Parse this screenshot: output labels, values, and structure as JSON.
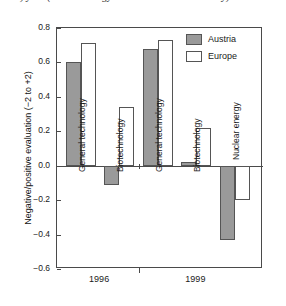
{
  "caption": "2.5.5) year (nuclear energy data collected in 1999 only)",
  "legend": {
    "position": "top-right",
    "entries": [
      {
        "label": "Austria",
        "swatch": "austria",
        "color": "#9a9a9a"
      },
      {
        "label": "Europe",
        "swatch": "europe",
        "color": "#ffffff"
      }
    ]
  },
  "axes": {
    "ylabel": "Negative/positive evaluation (−2 to +2)",
    "yticks": [
      0.8,
      0.6,
      0.4,
      0.2,
      0.0,
      -0.2,
      -0.4,
      -0.6
    ],
    "ytick_labels": [
      "0.8",
      "0.6",
      "0.4",
      "0.2",
      "0.0",
      "−0.2",
      "−0.4",
      "−0.6"
    ],
    "ylim": [
      -0.6,
      0.8
    ],
    "xlabel": ""
  },
  "groups": [
    {
      "label": "1996"
    },
    {
      "label": "1999"
    }
  ],
  "bar_labels": [
    "General technology",
    "Biotechnology",
    "General technology",
    "Biotechnology",
    "Nuclear energy"
  ],
  "chart_data": {
    "type": "bar",
    "title": "",
    "subtitle": "",
    "xlabel": "",
    "ylabel": "Negative/positive evaluation (−2 to +2)",
    "ylim": [
      -0.6,
      0.8
    ],
    "ytick_step": 0.2,
    "grid": false,
    "legend": [
      "Austria",
      "Europe"
    ],
    "legend_position": "top-right",
    "group_labels": [
      "1996",
      "1999"
    ],
    "categories": [
      "1996 General technology",
      "1996 Biotechnology",
      "1999 General technology",
      "1999 Biotechnology",
      "1999 Nuclear energy"
    ],
    "series": [
      {
        "name": "Austria",
        "color": "#9a9a9a",
        "values": [
          0.6,
          -0.11,
          0.68,
          0.02,
          -0.43
        ]
      },
      {
        "name": "Europe",
        "color": "#ffffff",
        "values": [
          0.71,
          0.34,
          0.73,
          0.22,
          -0.2
        ]
      }
    ]
  }
}
